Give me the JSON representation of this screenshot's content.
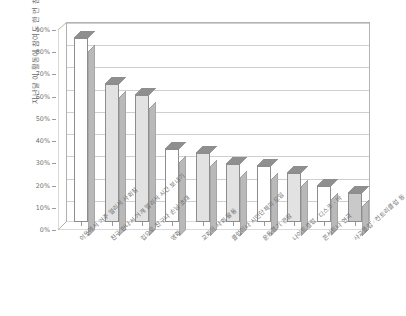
{
  "chart_data": {
    "type": "bar",
    "title": "",
    "subtitle": "",
    "xlabel": "",
    "ylabel": "지난달 이 활동에 참여도 한 번 참여한 성인의 비율",
    "ylim": [
      0,
      90
    ],
    "ytick_labels": [
      "0%",
      "10%",
      "20%",
      "30%",
      "40%",
      "50%",
      "60%",
      "70%",
      "80%",
      "90%"
    ],
    "ytick_values": [
      0,
      10,
      20,
      30,
      40,
      50,
      60,
      70,
      80,
      90
    ],
    "grid": true,
    "legend": "none",
    "style": "3d-column",
    "categories": [
      "이웃에서 거주 멀리서 사회참",
      "친구 만나서 거개 멀리서 시간 보내기",
      "집으로 친구나 손님 초대",
      "영화",
      "교회의 사회 활동",
      "클럽이나 시민단체의 모임",
      "운동경기 관람",
      "나이트클럽 · 디스코 · 바",
      "콘서트나 연극",
      "사교클럽 · 컨트리클럽 등"
    ],
    "values": [
      83,
      62,
      57,
      33,
      31,
      26,
      25,
      22,
      16,
      13
    ],
    "bar_fills": [
      "#ffffff",
      "#e2e2e2",
      "#e2e2e2",
      "#ffffff",
      "#e2e2e2",
      "#e2e2e2",
      "#ffffff",
      "#e2e2e2",
      "#ffffff",
      "#c9c9c9"
    ],
    "colors": {
      "bar_side": "#b9b9b9",
      "bar_top": "#8f8f8f",
      "bar_outline": "#8d8d8d",
      "gridline": "#cfcfcf",
      "axis": "#9a9a9a",
      "wall": "#b4b4b4",
      "text": "#6a6a6a",
      "background": "#ffffff"
    }
  }
}
